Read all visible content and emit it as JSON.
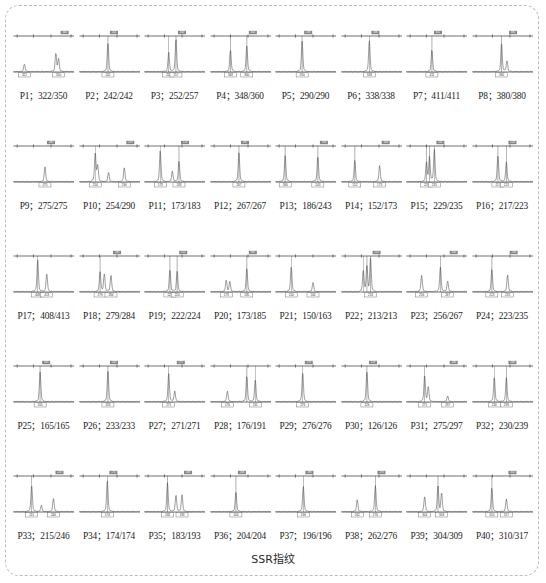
{
  "figure": {
    "caption": "SSR指纹",
    "border_color": "#bdbdbd",
    "trace_color": "#4d4d4d",
    "axis_color": "#333333",
    "label_box_color": "#555555",
    "columns": 8,
    "rows": 5
  },
  "chart_data": {
    "type": "line",
    "title": "SSR指纹",
    "xlabel": "",
    "ylabel": "",
    "panels": [
      {
        "id": "P1",
        "label": "P1；322/350",
        "alleles": [
          322,
          350
        ],
        "top_tick": "340",
        "bins": [
          "322",
          "350"
        ],
        "peaks": [
          {
            "x": 0.18,
            "h": 0.22
          },
          {
            "x": 0.7,
            "h": 0.52
          },
          {
            "x": 0.745,
            "h": 0.36
          }
        ]
      },
      {
        "id": "P2",
        "label": "P2；242/242",
        "alleles": [
          242,
          242
        ],
        "top_tick": "242",
        "bins": [
          "242"
        ],
        "peaks": [
          {
            "x": 0.47,
            "h": 0.8
          }
        ]
      },
      {
        "id": "P3",
        "label": "P3；252/257",
        "alleles": [
          252,
          257
        ],
        "top_tick": "260",
        "bins": [
          "252",
          "257"
        ],
        "peaks": [
          {
            "x": 0.4,
            "h": 0.55
          },
          {
            "x": 0.52,
            "h": 0.92
          }
        ]
      },
      {
        "id": "P4",
        "label": "P4；348/360",
        "alleles": [
          348,
          360
        ],
        "top_tick": "354",
        "bins": [
          "348",
          "360"
        ],
        "peaks": [
          {
            "x": 0.33,
            "h": 0.62
          },
          {
            "x": 0.6,
            "h": 0.74
          }
        ]
      },
      {
        "id": "P5",
        "label": "P5；290/290",
        "alleles": [
          290,
          290
        ],
        "top_tick": "290",
        "bins": [
          "290"
        ],
        "peaks": [
          {
            "x": 0.44,
            "h": 0.86
          }
        ]
      },
      {
        "id": "P6",
        "label": "P6；338/338",
        "alleles": [
          338,
          338
        ],
        "top_tick": "338",
        "bins": [
          "338"
        ],
        "peaks": [
          {
            "x": 0.46,
            "h": 0.88
          }
        ]
      },
      {
        "id": "P7",
        "label": "P7；411/411",
        "alleles": [
          411,
          411
        ],
        "top_tick": "411",
        "bins": [
          "411"
        ],
        "peaks": [
          {
            "x": 0.42,
            "h": 0.62
          }
        ]
      },
      {
        "id": "P8",
        "label": "P8；380/380",
        "alleles": [
          380,
          380
        ],
        "top_tick": "380",
        "bins": [
          "380"
        ],
        "peaks": [
          {
            "x": 0.48,
            "h": 0.8
          },
          {
            "x": 0.57,
            "h": 0.3
          }
        ]
      },
      {
        "id": "P9",
        "label": "P9；275/275",
        "alleles": [
          275,
          275
        ],
        "top_tick": "280",
        "bins": [
          "275"
        ],
        "peaks": [
          {
            "x": 0.52,
            "h": 0.42
          }
        ]
      },
      {
        "id": "P10",
        "label": "P10；254/290",
        "alleles": [
          254,
          290
        ],
        "top_tick": "270",
        "bins": [
          "254",
          "290"
        ],
        "peaks": [
          {
            "x": 0.26,
            "h": 0.8
          },
          {
            "x": 0.3,
            "h": 0.46
          },
          {
            "x": 0.48,
            "h": 0.26
          },
          {
            "x": 0.74,
            "h": 0.4
          }
        ]
      },
      {
        "id": "P11",
        "label": "P11；173/183",
        "alleles": [
          173,
          183
        ],
        "top_tick": "176",
        "bins": [
          "173",
          "183"
        ],
        "peaks": [
          {
            "x": 0.26,
            "h": 0.88
          },
          {
            "x": 0.46,
            "h": 0.3
          },
          {
            "x": 0.57,
            "h": 0.58
          }
        ]
      },
      {
        "id": "P12",
        "label": "P12；267/267",
        "alleles": [
          267,
          267
        ],
        "top_tick": "267",
        "bins": [
          "267"
        ],
        "peaks": [
          {
            "x": 0.47,
            "h": 0.82
          }
        ]
      },
      {
        "id": "P13",
        "label": "P13；186/243",
        "alleles": [
          186,
          243
        ],
        "top_tick": "190",
        "bins": [
          "186",
          "243"
        ],
        "peaks": [
          {
            "x": 0.16,
            "h": 0.74
          },
          {
            "x": 0.7,
            "h": 0.72
          }
        ]
      },
      {
        "id": "P14",
        "label": "P14；152/173",
        "alleles": [
          152,
          173
        ],
        "top_tick": "160",
        "bins": [
          "152",
          "173"
        ],
        "peaks": [
          {
            "x": 0.22,
            "h": 0.6
          },
          {
            "x": 0.63,
            "h": 0.45
          }
        ]
      },
      {
        "id": "P15",
        "label": "P15；229/235",
        "alleles": [
          229,
          235
        ],
        "top_tick": "232",
        "bins": [
          "229",
          "235"
        ],
        "peaks": [
          {
            "x": 0.33,
            "h": 0.55
          },
          {
            "x": 0.38,
            "h": 0.68
          },
          {
            "x": 0.46,
            "h": 0.92
          }
        ]
      },
      {
        "id": "P16",
        "label": "P16；217/223",
        "alleles": [
          217,
          223
        ],
        "top_tick": "220",
        "bins": [
          "217",
          "223"
        ],
        "peaks": [
          {
            "x": 0.42,
            "h": 0.74
          },
          {
            "x": 0.56,
            "h": 0.56
          }
        ]
      },
      {
        "id": "P17",
        "label": "P17；408/413",
        "alleles": [
          408,
          413
        ],
        "top_tick": "",
        "bins": [
          "408",
          "413"
        ],
        "peaks": [
          {
            "x": 0.4,
            "h": 0.9
          },
          {
            "x": 0.55,
            "h": 0.52
          }
        ]
      },
      {
        "id": "P18",
        "label": "P18；279/284",
        "alleles": [
          279,
          284
        ],
        "top_tick": "280",
        "bins": [
          "279",
          "284"
        ],
        "peaks": [
          {
            "x": 0.34,
            "h": 0.56
          },
          {
            "x": 0.41,
            "h": 0.5
          },
          {
            "x": 0.52,
            "h": 0.46
          }
        ]
      },
      {
        "id": "P19",
        "label": "P19；222/224",
        "alleles": [
          222,
          224
        ],
        "top_tick": "222",
        "bins": [
          "222",
          "224"
        ],
        "peaks": [
          {
            "x": 0.42,
            "h": 0.62
          },
          {
            "x": 0.54,
            "h": 0.58
          }
        ]
      },
      {
        "id": "P20",
        "label": "P20；173/185",
        "alleles": [
          173,
          185
        ],
        "top_tick": "185",
        "bins": [
          "173",
          "185"
        ],
        "peaks": [
          {
            "x": 0.26,
            "h": 0.32
          },
          {
            "x": 0.32,
            "h": 0.28
          },
          {
            "x": 0.6,
            "h": 0.66
          }
        ]
      },
      {
        "id": "P21",
        "label": "P21；150/163",
        "alleles": [
          150,
          163
        ],
        "top_tick": "",
        "bins": [
          "150",
          "163"
        ],
        "peaks": [
          {
            "x": 0.26,
            "h": 0.7
          },
          {
            "x": 0.62,
            "h": 0.26
          }
        ]
      },
      {
        "id": "P22",
        "label": "P22；213/213",
        "alleles": [
          213,
          213
        ],
        "top_tick": "213",
        "bins": [
          "213"
        ],
        "peaks": [
          {
            "x": 0.36,
            "h": 0.6
          },
          {
            "x": 0.42,
            "h": 0.72
          },
          {
            "x": 0.48,
            "h": 0.94
          }
        ]
      },
      {
        "id": "P23",
        "label": "P23；256/267",
        "alleles": [
          256,
          267
        ],
        "top_tick": "260",
        "bins": [
          "256",
          "267"
        ],
        "peaks": [
          {
            "x": 0.25,
            "h": 0.46
          },
          {
            "x": 0.56,
            "h": 0.7
          },
          {
            "x": 0.68,
            "h": 0.3
          }
        ]
      },
      {
        "id": "P24",
        "label": "P24；223/235",
        "alleles": [
          223,
          235
        ],
        "top_tick": "230",
        "bins": [
          "223",
          "235"
        ],
        "peaks": [
          {
            "x": 0.32,
            "h": 0.62
          },
          {
            "x": 0.58,
            "h": 0.48
          }
        ]
      },
      {
        "id": "P25",
        "label": "P25；165/165",
        "alleles": [
          165,
          165
        ],
        "top_tick": "165",
        "bins": [
          "165"
        ],
        "peaks": [
          {
            "x": 0.44,
            "h": 0.84
          }
        ]
      },
      {
        "id": "P26",
        "label": "P26；233/233",
        "alleles": [
          233,
          233
        ],
        "top_tick": "240",
        "bins": [
          "233"
        ],
        "peaks": [
          {
            "x": 0.47,
            "h": 0.86
          }
        ]
      },
      {
        "id": "P27",
        "label": "P27；271/271",
        "alleles": [
          271,
          271
        ],
        "top_tick": "271",
        "bins": [
          "271"
        ],
        "peaks": [
          {
            "x": 0.4,
            "h": 0.8
          },
          {
            "x": 0.5,
            "h": 0.3
          }
        ]
      },
      {
        "id": "P28",
        "label": "P28；176/191",
        "alleles": [
          176,
          191
        ],
        "top_tick": "",
        "bins": [
          "176",
          "191"
        ],
        "peaks": [
          {
            "x": 0.28,
            "h": 0.3
          },
          {
            "x": 0.6,
            "h": 0.72
          },
          {
            "x": 0.74,
            "h": 0.62
          }
        ]
      },
      {
        "id": "P29",
        "label": "P29；276/276",
        "alleles": [
          276,
          276
        ],
        "top_tick": "276",
        "bins": [
          "276"
        ],
        "peaks": [
          {
            "x": 0.45,
            "h": 0.84
          }
        ]
      },
      {
        "id": "P30",
        "label": "P30；126/126",
        "alleles": [
          126,
          126
        ],
        "top_tick": "126",
        "bins": [
          "126"
        ],
        "peaks": [
          {
            "x": 0.42,
            "h": 0.86
          }
        ]
      },
      {
        "id": "P31",
        "label": "P31；275/297",
        "alleles": [
          275,
          297
        ],
        "top_tick": "280",
        "bins": [
          "275",
          "297"
        ],
        "peaks": [
          {
            "x": 0.3,
            "h": 0.74
          },
          {
            "x": 0.36,
            "h": 0.42
          },
          {
            "x": 0.68,
            "h": 0.16
          }
        ]
      },
      {
        "id": "P32",
        "label": "P32；230/239",
        "alleles": [
          230,
          239
        ],
        "top_tick": "236",
        "bins": [
          "230",
          "239"
        ],
        "peaks": [
          {
            "x": 0.36,
            "h": 0.7
          },
          {
            "x": 0.56,
            "h": 0.68
          }
        ]
      },
      {
        "id": "P33",
        "label": "P33；215/246",
        "alleles": [
          215,
          246
        ],
        "top_tick": "220",
        "bins": [
          "215",
          "246"
        ],
        "peaks": [
          {
            "x": 0.3,
            "h": 0.76
          },
          {
            "x": 0.46,
            "h": 0.18
          },
          {
            "x": 0.66,
            "h": 0.38
          }
        ]
      },
      {
        "id": "P34",
        "label": "P34；174/174",
        "alleles": [
          174,
          174
        ],
        "top_tick": "174",
        "bins": [
          "174"
        ],
        "peaks": [
          {
            "x": 0.46,
            "h": 0.88
          }
        ]
      },
      {
        "id": "P35",
        "label": "P35；183/193",
        "alleles": [
          183,
          193
        ],
        "top_tick": "190",
        "bins": [
          "183",
          "193"
        ],
        "peaks": [
          {
            "x": 0.38,
            "h": 0.82
          },
          {
            "x": 0.52,
            "h": 0.46
          },
          {
            "x": 0.62,
            "h": 0.48
          }
        ]
      },
      {
        "id": "P36",
        "label": "P36；204/204",
        "alleles": [
          204,
          204
        ],
        "top_tick": "204",
        "bins": [
          "204"
        ],
        "peaks": [
          {
            "x": 0.42,
            "h": 0.56
          }
        ]
      },
      {
        "id": "P37",
        "label": "P37；196/196",
        "alleles": [
          196,
          196
        ],
        "top_tick": "196",
        "bins": [
          "196"
        ],
        "peaks": [
          {
            "x": 0.46,
            "h": 0.72
          }
        ]
      },
      {
        "id": "P38",
        "label": "P38；262/276",
        "alleles": [
          262,
          276
        ],
        "top_tick": "276",
        "bins": [
          "262",
          "276"
        ],
        "peaks": [
          {
            "x": 0.26,
            "h": 0.34
          },
          {
            "x": 0.56,
            "h": 0.74
          }
        ]
      },
      {
        "id": "P39",
        "label": "P39；304/309",
        "alleles": [
          304,
          309
        ],
        "top_tick": "",
        "bins": [
          "304",
          "309"
        ],
        "peaks": [
          {
            "x": 0.3,
            "h": 0.44
          },
          {
            "x": 0.52,
            "h": 0.72
          },
          {
            "x": 0.58,
            "h": 0.52
          }
        ]
      },
      {
        "id": "P40",
        "label": "P40；310/317",
        "alleles": [
          310,
          317
        ],
        "top_tick": "310",
        "bins": [
          "310",
          "317"
        ],
        "peaks": [
          {
            "x": 0.32,
            "h": 0.66
          },
          {
            "x": 0.56,
            "h": 0.36
          }
        ]
      }
    ]
  }
}
